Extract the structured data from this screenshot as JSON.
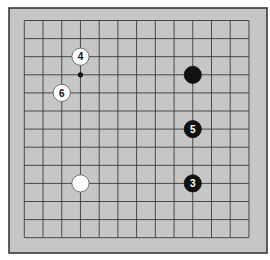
{
  "board": {
    "size": 13,
    "colors": {
      "board": "#c6c6c6",
      "border": "#3a3a3a",
      "grid": "#3a3a3a",
      "black_stone": "#111111",
      "white_stone": "#ffffff",
      "white_outline": "#555555"
    },
    "geometry": {
      "outer": {
        "x": 9,
        "y": 8,
        "w": 258,
        "h": 245
      },
      "grid_x0": 24.3,
      "grid_y0": 20.5,
      "dx": 18.72,
      "dy": 18.1
    },
    "stones": [
      {
        "color": "white",
        "col": 3,
        "row": 2,
        "label": "4"
      },
      {
        "color": "white",
        "col": 2,
        "row": 4,
        "label": "6"
      },
      {
        "color": "black",
        "col": 9,
        "row": 3,
        "label": ""
      },
      {
        "color": "black",
        "col": 9,
        "row": 6,
        "label": "5"
      },
      {
        "color": "black",
        "col": 9,
        "row": 9,
        "label": "3"
      },
      {
        "color": "white",
        "col": 3,
        "row": 9,
        "label": ""
      }
    ],
    "markers": [
      {
        "type": "dot",
        "col": 3,
        "row": 3
      }
    ]
  }
}
